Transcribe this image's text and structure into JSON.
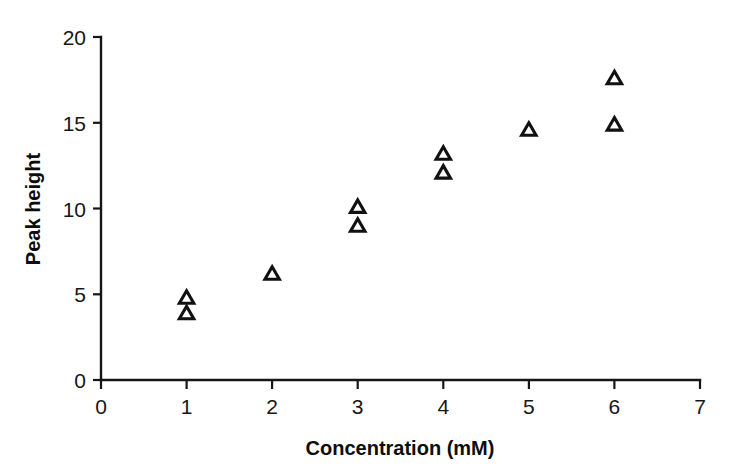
{
  "chart_data": {
    "type": "scatter",
    "title": "",
    "subtitle": "",
    "xlabel": "Concentration (mM)",
    "ylabel": "Peak height",
    "xlim": [
      0,
      7
    ],
    "ylim": [
      0,
      20
    ],
    "xticks": [
      0,
      1,
      2,
      3,
      4,
      5,
      6,
      7
    ],
    "yticks": [
      0,
      5,
      10,
      15,
      20
    ],
    "xtick_labels": [
      "0",
      "1",
      "2",
      "3",
      "4",
      "5",
      "6",
      "7"
    ],
    "ytick_labels": [
      "0",
      "5",
      "10",
      "15",
      "20"
    ],
    "grid": false,
    "legend": null,
    "legend_position": "none",
    "marker": "open-triangle-up",
    "marker_color": "#111111",
    "marker_fill": "#ffffff",
    "series": [
      {
        "name": "Peak height vs concentration",
        "points": [
          {
            "x": 1,
            "y": 4.8
          },
          {
            "x": 1,
            "y": 3.9
          },
          {
            "x": 2,
            "y": 6.2
          },
          {
            "x": 3,
            "y": 10.1
          },
          {
            "x": 3,
            "y": 9.0
          },
          {
            "x": 4,
            "y": 13.2
          },
          {
            "x": 4,
            "y": 12.1
          },
          {
            "x": 5,
            "y": 14.6
          },
          {
            "x": 6,
            "y": 17.6
          },
          {
            "x": 6,
            "y": 14.9
          }
        ]
      }
    ],
    "annotations": []
  },
  "axes": {
    "x_title": "Concentration (mM)",
    "y_title": "Peak height"
  }
}
